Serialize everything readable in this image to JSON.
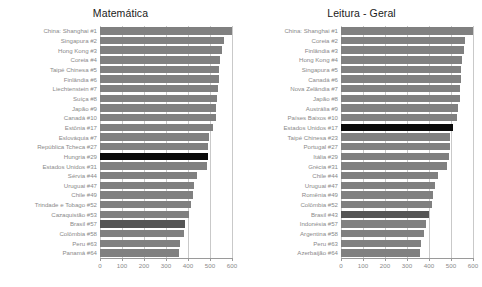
{
  "figure": {
    "background_color": "#ffffff",
    "bar_color": "#808080",
    "highlight_black_color": "#0a0a0a",
    "highlight_dark_color": "#555555",
    "label_color": "#8a8a8a",
    "grid_color": "#c9c9c9"
  },
  "chart_data": [
    {
      "type": "bar",
      "orientation": "horizontal",
      "title": "Matemática",
      "xlabel": "",
      "ylabel": "",
      "xlim": [
        0,
        600
      ],
      "ticks": [
        0,
        100,
        200,
        300,
        400,
        500,
        600
      ],
      "tick_labels": [
        "0",
        "100",
        "200",
        "300",
        "400",
        "500",
        "600"
      ],
      "grid": true,
      "legend": "none",
      "categories": [
        "China: Shanghai #1",
        "Singapura #2",
        "Hong Kong #3",
        "Coreia #4",
        "Taipé Chinesa #5",
        "Finlândia #6",
        "Liechtenstein #7",
        "Suíça #8",
        "Japão #9",
        "Canadá #10",
        "Estônia #17",
        "Eslováquia #7",
        "República Tcheca #27",
        "Hungria #29",
        "Estados Unidos #31",
        "Sérvia #44",
        "Uruguai #47",
        "Chile #49",
        "Trindade e Tobago #52",
        "Cazaquistão #53",
        "Brasil #57",
        "Colômbia #58",
        "Peru #63",
        "Panamá #64"
      ],
      "values": [
        600,
        562,
        555,
        546,
        543,
        541,
        536,
        534,
        529,
        527,
        512,
        497,
        493,
        490,
        487,
        442,
        427,
        421,
        414,
        405,
        386,
        381,
        365,
        360
      ],
      "highlights": {
        "Hungria #29": "black",
        "Brasil #57": "dark"
      }
    },
    {
      "type": "bar",
      "orientation": "horizontal",
      "title": "Leitura - Geral",
      "xlabel": "",
      "ylabel": "",
      "xlim": [
        0,
        600
      ],
      "ticks": [
        0,
        100,
        200,
        300,
        400,
        500,
        600
      ],
      "tick_labels": [
        "0",
        "100",
        "200",
        "300",
        "400",
        "500",
        "600"
      ],
      "grid": true,
      "legend": "none",
      "categories": [
        "China: Shanghai #1",
        "Coreia #2",
        "Finlândia #3",
        "Hong Kong #4",
        "Singapura #5",
        "Canadá #6",
        "Nova Zelândia #7",
        "Japão #8",
        "Austrália #9",
        "Países Baixos #10",
        "Estados Unidos #17",
        "Taipé Chinesa #23",
        "Portugal #27",
        "Itália #29",
        "Grécia #31",
        "Chile #44",
        "Uruguai #47",
        "Romênia #49",
        "Colômbia #52",
        "Brasil #43",
        "Indonésia #57",
        "Argentina #58",
        "Peru #63",
        "Azerbaijão #64"
      ],
      "values": [
        600,
        563,
        559,
        548,
        546,
        544,
        542,
        540,
        533,
        529,
        511,
        497,
        494,
        489,
        484,
        441,
        427,
        418,
        414,
        400,
        385,
        379,
        365,
        357
      ],
      "highlights": {
        "Estados Unidos #17": "black",
        "Brasil #43": "dark"
      }
    }
  ]
}
